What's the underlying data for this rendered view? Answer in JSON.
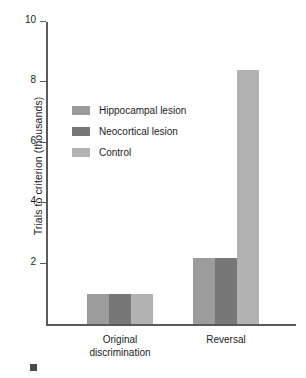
{
  "chart_data": {
    "type": "bar",
    "title": "",
    "subtitle": "",
    "xlabel": "",
    "ylabel": "Trials to criterion (thousands)",
    "categories": [
      "Original\ndiscrimination",
      "Reversal"
    ],
    "category_labels_flat": [
      "Original discrimination",
      "Reversal"
    ],
    "series": [
      {
        "name": "Hippocampal lesion",
        "values": [
          1.0,
          2.2
        ],
        "color": "#9c9c9c"
      },
      {
        "name": "Neocortical lesion",
        "values": [
          1.0,
          2.2
        ],
        "color": "#777777"
      },
      {
        "name": "Control",
        "values": [
          1.0,
          8.4
        ],
        "color": "#b2b2b2"
      }
    ],
    "ylim": [
      0,
      10
    ],
    "yticks": [
      2,
      4,
      6,
      8,
      10
    ],
    "ytick_labels": [
      "2",
      "4",
      "6",
      "8",
      "10"
    ],
    "grid": false,
    "legend_position": "upper-left-inside",
    "axis_color": "#5a5a5a",
    "background": "#ffffff"
  },
  "legend": {
    "items": [
      {
        "label": "Hippocampal lesion",
        "color": "#9c9c9c"
      },
      {
        "label": "Neocortical lesion",
        "color": "#777777"
      },
      {
        "label": "Control",
        "color": "#b2b2b2"
      }
    ]
  },
  "axes": {
    "y_title": "Trials to criterion (thousands)",
    "y_tick_labels": [
      "10",
      "8",
      "6",
      "4",
      "2"
    ],
    "x_tick_labels": [
      "Original\ndiscrimination",
      "Reversal"
    ]
  },
  "footnote": {
    "marker_color": "#4a4a4a"
  }
}
